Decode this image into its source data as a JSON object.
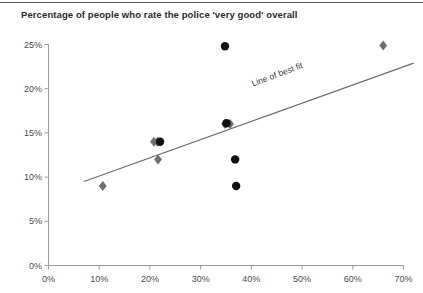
{
  "chart_data": {
    "type": "scatter",
    "title": "Percentage of people who rate the police 'very good' overall",
    "xlabel": "",
    "ylabel": "",
    "xlim": [
      0,
      70
    ],
    "ylim": [
      0,
      25
    ],
    "grid": false,
    "legend": "none",
    "x_ticks": [
      "0%",
      "10%",
      "20%",
      "30%",
      "40%",
      "50%",
      "60%",
      "70%"
    ],
    "x_tick_values": [
      0,
      10,
      20,
      30,
      40,
      50,
      60,
      70
    ],
    "y_ticks": [
      "0%",
      "5%",
      "10%",
      "15%",
      "20%",
      "25%"
    ],
    "y_tick_values": [
      0,
      5,
      10,
      15,
      20,
      25
    ],
    "series": [
      {
        "name": "diamonds",
        "marker": "diamond",
        "color": "#6e6e6e",
        "points": [
          {
            "x": 10.7,
            "y": 9.0
          },
          {
            "x": 20.8,
            "y": 14.0
          },
          {
            "x": 21.5,
            "y": 14.0
          },
          {
            "x": 21.6,
            "y": 12.0
          },
          {
            "x": 34.8,
            "y": 16.0
          },
          {
            "x": 35.8,
            "y": 16.0
          },
          {
            "x": 66.0,
            "y": 24.9
          }
        ]
      },
      {
        "name": "circles",
        "marker": "circle",
        "color": "#111111",
        "points": [
          {
            "x": 22.0,
            "y": 14.0
          },
          {
            "x": 34.8,
            "y": 24.8
          },
          {
            "x": 35.1,
            "y": 16.1
          },
          {
            "x": 36.8,
            "y": 12.0
          },
          {
            "x": 37.0,
            "y": 9.0
          }
        ]
      }
    ],
    "annotations": [
      {
        "name": "line-of-best-fit-label",
        "text": "Line of best fit",
        "x": 45,
        "y": 20.5,
        "rotation": -20.5
      }
    ],
    "trendline": {
      "name": "line-of-best-fit",
      "color": "#6a6a6a",
      "x1": 7.0,
      "y1": 9.5,
      "x2": 72.0,
      "y2": 22.9
    }
  },
  "axis_colors": {
    "axis_line": "#9a9a9a",
    "tick": "#9a9a9a",
    "text": "#4a4a4a"
  }
}
